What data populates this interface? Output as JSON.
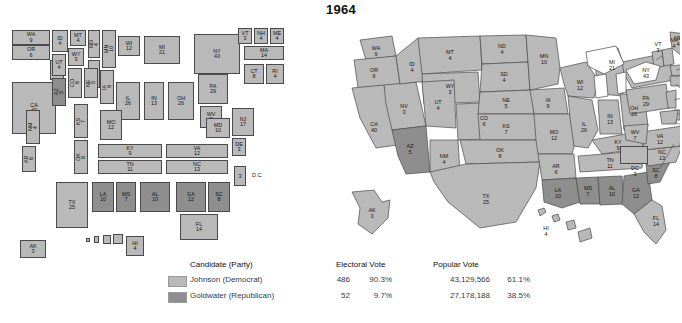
{
  "title": "1964",
  "colors": {
    "democrat": "#b9b9b9",
    "republican": "#8e8e8e",
    "water": "#ffffff",
    "border": "#4a4a4a"
  },
  "legend": {
    "headers": {
      "candidate": "Candidate (Party)",
      "electoral": "Electoral Vote",
      "popular": "Popular Vote"
    },
    "rows": [
      {
        "swatch": "democrat",
        "candidate": "Johnson (Democrat)",
        "electoral_votes": "486",
        "electoral_pct": "90.3%",
        "popular_votes": "43,129,566",
        "popular_pct": "61.1%"
      },
      {
        "swatch": "republican",
        "candidate": "Goldwater (Republican)",
        "electoral_votes": "52",
        "electoral_pct": "9.7%",
        "popular_votes": "27,178,188",
        "popular_pct": "38.5%"
      }
    ]
  },
  "cartogram": {
    "name": "electoral-cartogram",
    "dc": {
      "label": "D.C.",
      "votes": "3"
    },
    "states": [
      {
        "abbr": "WA",
        "votes": "9",
        "party": "democrat"
      },
      {
        "abbr": "OR",
        "votes": "6",
        "party": "democrat"
      },
      {
        "abbr": "NV",
        "votes": "3",
        "party": "democrat"
      },
      {
        "abbr": "CA",
        "votes": "40",
        "party": "democrat"
      },
      {
        "abbr": "ID",
        "votes": "4",
        "party": "democrat"
      },
      {
        "abbr": "MT",
        "votes": "4",
        "party": "democrat"
      },
      {
        "abbr": "ND",
        "votes": "4",
        "party": "democrat"
      },
      {
        "abbr": "MN",
        "votes": "10",
        "party": "democrat"
      },
      {
        "abbr": "UT",
        "votes": "4",
        "party": "democrat"
      },
      {
        "abbr": "WY",
        "votes": "3",
        "party": "democrat"
      },
      {
        "abbr": "SD",
        "votes": "4",
        "party": "democrat"
      },
      {
        "abbr": "AZ",
        "votes": "5",
        "party": "republican"
      },
      {
        "abbr": "CO",
        "votes": "6",
        "party": "democrat"
      },
      {
        "abbr": "NE",
        "votes": "5",
        "party": "democrat"
      },
      {
        "abbr": "IA",
        "votes": "9",
        "party": "democrat"
      },
      {
        "abbr": "WI",
        "votes": "12",
        "party": "democrat"
      },
      {
        "abbr": "MI",
        "votes": "21",
        "party": "democrat"
      },
      {
        "abbr": "NY",
        "votes": "43",
        "party": "democrat"
      },
      {
        "abbr": "VT",
        "votes": "3",
        "party": "democrat"
      },
      {
        "abbr": "NH",
        "votes": "4",
        "party": "democrat"
      },
      {
        "abbr": "ME",
        "votes": "4",
        "party": "democrat"
      },
      {
        "abbr": "MA",
        "votes": "14",
        "party": "democrat"
      },
      {
        "abbr": "CT",
        "votes": "8",
        "party": "democrat"
      },
      {
        "abbr": "RI",
        "votes": "4",
        "party": "democrat"
      },
      {
        "abbr": "NM",
        "votes": "4",
        "party": "democrat"
      },
      {
        "abbr": "KS",
        "votes": "7",
        "party": "democrat"
      },
      {
        "abbr": "IL",
        "votes": "26",
        "party": "democrat"
      },
      {
        "abbr": "IN",
        "votes": "13",
        "party": "democrat"
      },
      {
        "abbr": "OH",
        "votes": "26",
        "party": "democrat"
      },
      {
        "abbr": "PA",
        "votes": "29",
        "party": "democrat"
      },
      {
        "abbr": "NJ",
        "votes": "17",
        "party": "democrat"
      },
      {
        "abbr": "MO",
        "votes": "12",
        "party": "democrat"
      },
      {
        "abbr": "WV",
        "votes": "7",
        "party": "democrat"
      },
      {
        "abbr": "MD",
        "votes": "10",
        "party": "democrat"
      },
      {
        "abbr": "DE",
        "votes": "3",
        "party": "democrat"
      },
      {
        "abbr": "OK",
        "votes": "8",
        "party": "democrat"
      },
      {
        "abbr": "KY",
        "votes": "9",
        "party": "democrat"
      },
      {
        "abbr": "VA",
        "votes": "12",
        "party": "democrat"
      },
      {
        "abbr": "AR",
        "votes": "6",
        "party": "democrat"
      },
      {
        "abbr": "TN",
        "votes": "11",
        "party": "democrat"
      },
      {
        "abbr": "NC",
        "votes": "13",
        "party": "democrat"
      },
      {
        "abbr": "TX",
        "votes": "25",
        "party": "democrat"
      },
      {
        "abbr": "LA",
        "votes": "10",
        "party": "republican"
      },
      {
        "abbr": "MS",
        "votes": "7",
        "party": "republican"
      },
      {
        "abbr": "AL",
        "votes": "10",
        "party": "republican"
      },
      {
        "abbr": "GA",
        "votes": "12",
        "party": "republican"
      },
      {
        "abbr": "SC",
        "votes": "8",
        "party": "republican"
      },
      {
        "abbr": "FL",
        "votes": "14",
        "party": "democrat"
      },
      {
        "abbr": "AK",
        "votes": "3",
        "party": "democrat"
      },
      {
        "abbr": "HI",
        "votes": "4",
        "party": "democrat"
      }
    ]
  },
  "geomap": {
    "name": "geographic-electoral-map",
    "dc": {
      "label": "DC",
      "votes": "3"
    },
    "states": [
      {
        "abbr": "WA",
        "votes": "9",
        "party": "democrat"
      },
      {
        "abbr": "OR",
        "votes": "6",
        "party": "democrat"
      },
      {
        "abbr": "CA",
        "votes": "40",
        "party": "democrat"
      },
      {
        "abbr": "NV",
        "votes": "3",
        "party": "democrat"
      },
      {
        "abbr": "ID",
        "votes": "4",
        "party": "democrat"
      },
      {
        "abbr": "MT",
        "votes": "4",
        "party": "democrat"
      },
      {
        "abbr": "WY",
        "votes": "3",
        "party": "democrat"
      },
      {
        "abbr": "UT",
        "votes": "4",
        "party": "democrat"
      },
      {
        "abbr": "AZ",
        "votes": "5",
        "party": "republican"
      },
      {
        "abbr": "CO",
        "votes": "6",
        "party": "democrat"
      },
      {
        "abbr": "NM",
        "votes": "4",
        "party": "democrat"
      },
      {
        "abbr": "ND",
        "votes": "4",
        "party": "democrat"
      },
      {
        "abbr": "SD",
        "votes": "4",
        "party": "democrat"
      },
      {
        "abbr": "NE",
        "votes": "5",
        "party": "democrat"
      },
      {
        "abbr": "KS",
        "votes": "7",
        "party": "democrat"
      },
      {
        "abbr": "OK",
        "votes": "8",
        "party": "democrat"
      },
      {
        "abbr": "TX",
        "votes": "25",
        "party": "democrat"
      },
      {
        "abbr": "MN",
        "votes": "10",
        "party": "democrat"
      },
      {
        "abbr": "IA",
        "votes": "9",
        "party": "democrat"
      },
      {
        "abbr": "MO",
        "votes": "12",
        "party": "democrat"
      },
      {
        "abbr": "AR",
        "votes": "6",
        "party": "democrat"
      },
      {
        "abbr": "LA",
        "votes": "10",
        "party": "republican"
      },
      {
        "abbr": "WI",
        "votes": "12",
        "party": "democrat"
      },
      {
        "abbr": "IL",
        "votes": "26",
        "party": "democrat"
      },
      {
        "abbr": "MS",
        "votes": "7",
        "party": "republican"
      },
      {
        "abbr": "AL",
        "votes": "10",
        "party": "republican"
      },
      {
        "abbr": "MI",
        "votes": "21",
        "party": "democrat"
      },
      {
        "abbr": "IN",
        "votes": "13",
        "party": "democrat"
      },
      {
        "abbr": "OH",
        "votes": "26",
        "party": "democrat"
      },
      {
        "abbr": "KY",
        "votes": "9",
        "party": "democrat"
      },
      {
        "abbr": "TN",
        "votes": "11",
        "party": "democrat"
      },
      {
        "abbr": "GA",
        "votes": "12",
        "party": "republican"
      },
      {
        "abbr": "SC",
        "votes": "8",
        "party": "republican"
      },
      {
        "abbr": "NC",
        "votes": "13",
        "party": "democrat"
      },
      {
        "abbr": "VA",
        "votes": "12",
        "party": "democrat"
      },
      {
        "abbr": "WV",
        "votes": "7",
        "party": "democrat"
      },
      {
        "abbr": "PA",
        "votes": "29",
        "party": "democrat"
      },
      {
        "abbr": "NY",
        "votes": "43",
        "party": "democrat"
      },
      {
        "abbr": "VT",
        "votes": "3",
        "party": "democrat"
      },
      {
        "abbr": "NH",
        "votes": "4",
        "party": "democrat"
      },
      {
        "abbr": "ME",
        "votes": "4",
        "party": "democrat"
      },
      {
        "abbr": "MA",
        "votes": "14",
        "party": "democrat"
      },
      {
        "abbr": "RI",
        "votes": "4",
        "party": "democrat"
      },
      {
        "abbr": "CT",
        "votes": "8",
        "party": "democrat"
      },
      {
        "abbr": "NJ",
        "votes": "17",
        "party": "democrat"
      },
      {
        "abbr": "DE",
        "votes": "3",
        "party": "democrat"
      },
      {
        "abbr": "MD",
        "votes": "10",
        "party": "democrat"
      },
      {
        "abbr": "FL",
        "votes": "14",
        "party": "democrat"
      },
      {
        "abbr": "AK",
        "votes": "3",
        "party": "democrat"
      },
      {
        "abbr": "HI",
        "votes": "4",
        "party": "democrat"
      }
    ]
  }
}
